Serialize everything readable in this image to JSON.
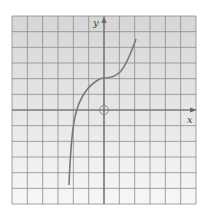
{
  "figure": {
    "type": "graph-on-grid",
    "axes": {
      "x_label": "x",
      "y_label": "y"
    },
    "grid": {
      "columns": 12,
      "rows": 12,
      "x_range": [
        -6,
        6
      ],
      "y_range": [
        -6,
        6
      ]
    },
    "curve": {
      "description": "cubic-like curve with horizontal inflection at (0, 2)",
      "points": [
        [
          -2.3,
          -4.8
        ],
        [
          -2.1,
          -2
        ],
        [
          -1.8,
          0
        ],
        [
          -1.2,
          1.1
        ],
        [
          -0.6,
          1.8
        ],
        [
          0,
          2
        ],
        [
          0.7,
          2.2
        ],
        [
          1.4,
          3
        ],
        [
          2.1,
          4.6
        ]
      ],
      "color": "#777777"
    },
    "open_circle": {
      "x": 0,
      "y": 0
    },
    "colors": {
      "background_top": "#d9d9d9",
      "background_bottom": "#f6f6f6",
      "grid": "#8a8a8a",
      "axis": "#707070"
    }
  }
}
